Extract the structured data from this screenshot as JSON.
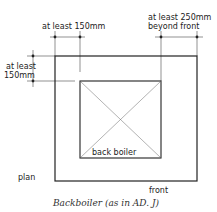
{
  "diagram": {
    "labels": {
      "top_left": "at least 150mm",
      "top_right_line1": "at least 250mm",
      "top_right_line2": "beyond front",
      "left_line1": "at least",
      "left_line2": "150mm",
      "inner": "back boiler",
      "plan": "plan",
      "front": "front"
    },
    "caption": "Backboiler (as in AD. J)"
  }
}
